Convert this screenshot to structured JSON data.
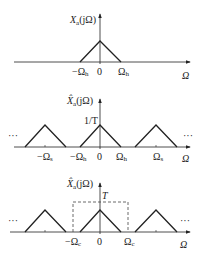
{
  "diagram": {
    "type": "sampling-spectrum-diagram",
    "line_color": "#222222",
    "panels": [
      {
        "id": "original-spectrum",
        "ylabel": "X",
        "ylabel_sub": "a",
        "ylabel_arg": "(jΩ)",
        "xlabel": "Ω",
        "ticks": [
          "−Ω",
          "0",
          "Ω"
        ],
        "tick_subs": [
          "h",
          "",
          "h"
        ],
        "peak_label": ""
      },
      {
        "id": "sampled-spectrum",
        "ylabel": "X̂",
        "ylabel_sub": "a",
        "ylabel_arg": "(jΩ)",
        "xlabel": "Ω",
        "ticks": [
          "−Ω",
          "−Ω",
          "0",
          "Ω",
          "Ω"
        ],
        "tick_subs": [
          "s",
          "h",
          "",
          "h",
          "s"
        ],
        "peak_label": "1/T",
        "ellipsis": "···"
      },
      {
        "id": "reconstruction-filter",
        "ylabel": "X̂",
        "ylabel_sub": "a",
        "ylabel_arg": "(jΩ)",
        "xlabel": "Ω",
        "ticks": [
          "−Ω",
          "0",
          "Ω"
        ],
        "tick_subs": [
          "c",
          "",
          "c"
        ],
        "filter_gain_label": "T",
        "ellipsis": "···"
      }
    ]
  }
}
